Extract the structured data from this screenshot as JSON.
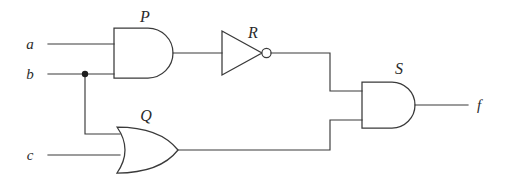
{
  "diagram": {
    "background_color": "#ffffff",
    "line_color": "#3a3a3a",
    "text_color": "#2b2b2b",
    "inputs": [
      {
        "id": "a",
        "label": "a",
        "x": 30,
        "y": 44
      },
      {
        "id": "b",
        "label": "b",
        "x": 30,
        "y": 78
      },
      {
        "id": "c",
        "label": "c",
        "x": 30,
        "y": 155
      }
    ],
    "outputs": [
      {
        "id": "f",
        "label": "f",
        "x": 479,
        "y": 104
      }
    ],
    "gates": [
      {
        "id": "P",
        "label": "P",
        "type": "AND",
        "label_x": 145,
        "label_y": 22,
        "inputs": [
          "a",
          "b"
        ],
        "output": "P"
      },
      {
        "id": "R",
        "label": "R",
        "type": "NOT",
        "label_x": 253,
        "label_y": 38,
        "inputs": [
          "P"
        ],
        "output": "R"
      },
      {
        "id": "Q",
        "label": "Q",
        "type": "OR",
        "label_x": 146,
        "label_y": 121,
        "inputs": [
          "b",
          "c"
        ],
        "output": "Q"
      },
      {
        "id": "S",
        "label": "S",
        "type": "AND",
        "label_x": 399,
        "label_y": 74,
        "inputs": [
          "R",
          "Q"
        ],
        "output": "f"
      }
    ],
    "junctions": [
      {
        "id": "b-fanout",
        "x": 85,
        "y": 74,
        "radius": 3.2
      }
    ],
    "expression": "f = NOT(a AND b) AND (b OR c)"
  }
}
